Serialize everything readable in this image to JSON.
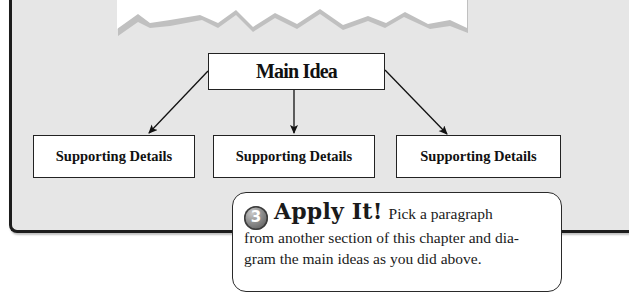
{
  "diagram": {
    "main_idea": "Main Idea",
    "details": [
      {
        "label": "Supporting Details"
      },
      {
        "label": "Supporting Details"
      },
      {
        "label": "Supporting Details"
      }
    ]
  },
  "callout": {
    "step_number": "3",
    "title": "Apply It!",
    "lead_text": "Pick a paragraph",
    "body_text": "from another section of this chapter and dia-gram the main ideas as you did above.",
    "body_line1": "from another section of this chapter and dia-",
    "body_line2": "gram the main ideas as you did above."
  },
  "colors": {
    "panel_background": "#e6e6e6",
    "panel_border": "#1c1c1c",
    "torn_shadow": "#bdbdbd",
    "box_fill": "#ffffff"
  }
}
